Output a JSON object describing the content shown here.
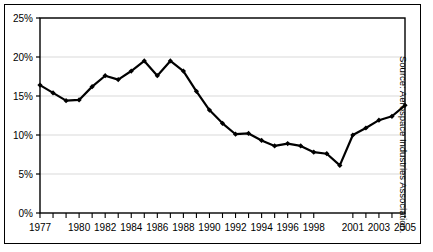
{
  "chart_data": {
    "type": "line",
    "title": "",
    "subtitle": "",
    "xlabel": "",
    "ylabel": "",
    "ylim": [
      0,
      25
    ],
    "ytick_labels": [
      "0%",
      "5%",
      "10%",
      "15%",
      "20%",
      "25%"
    ],
    "ytick_values": [
      0,
      5,
      10,
      15,
      20,
      25
    ],
    "xtick_labels": [
      "1977",
      "1980",
      "1982",
      "1984",
      "1986",
      "1988",
      "1990",
      "1992",
      "1994",
      "1996",
      "1998",
      "2001",
      "2003",
      "2005"
    ],
    "xlim": [
      1977,
      2005
    ],
    "grid": true,
    "legend": false,
    "markers": true,
    "series": [
      {
        "name": "series-1",
        "x": [
          1977,
          1978,
          1979,
          1980,
          1981,
          1982,
          1983,
          1984,
          1985,
          1986,
          1987,
          1988,
          1989,
          1990,
          1991,
          1992,
          1993,
          1994,
          1995,
          1996,
          1997,
          1998
        ],
        "values": [
          16.4,
          15.4,
          14.4,
          14.5,
          16.2,
          17.6,
          17.1,
          18.2,
          19.5,
          17.6,
          19.5,
          18.2,
          15.6,
          13.2,
          11.5,
          10.1,
          10.2,
          9.3,
          8.6,
          8.9,
          8.6,
          7.8
        ]
      },
      {
        "name": "series-2",
        "x": [
          1999,
          2000,
          2001,
          2002,
          2003,
          2004,
          2005
        ],
        "values": [
          7.6,
          6.1,
          10.0,
          10.9,
          11.9,
          12.4,
          13.2
        ]
      },
      {
        "name": "series-3",
        "x": [
          2005
        ],
        "values": [
          13.8
        ]
      }
    ],
    "points": [
      {
        "year": 1977,
        "value": 16.4
      },
      {
        "year": 1978,
        "value": 15.4
      },
      {
        "year": 1979,
        "value": 14.4
      },
      {
        "year": 1980,
        "value": 14.5
      },
      {
        "year": 1981,
        "value": 16.2
      },
      {
        "year": 1982,
        "value": 17.6
      },
      {
        "year": 1983,
        "value": 17.1
      },
      {
        "year": 1984,
        "value": 18.2
      },
      {
        "year": 1985,
        "value": 19.5
      },
      {
        "year": 1986,
        "value": 17.6
      },
      {
        "year": 1987,
        "value": 19.5
      },
      {
        "year": 1988,
        "value": 18.2
      },
      {
        "year": 1989,
        "value": 15.6
      },
      {
        "year": 1990,
        "value": 13.2
      },
      {
        "year": 1991,
        "value": 11.5
      },
      {
        "year": 1992,
        "value": 10.1
      },
      {
        "year": 1993,
        "value": 10.2
      },
      {
        "year": 1994,
        "value": 9.3
      },
      {
        "year": 1995,
        "value": 8.6
      },
      {
        "year": 1996,
        "value": 8.9
      },
      {
        "year": 1997,
        "value": 8.6
      },
      {
        "year": 1998,
        "value": 7.8
      },
      {
        "year": 1999,
        "value": 7.6
      },
      {
        "year": 2000,
        "value": 6.1
      },
      {
        "year": 2001,
        "value": 10.0
      },
      {
        "year": 2002,
        "value": 10.9
      },
      {
        "year": 2003,
        "value": 11.9
      },
      {
        "year": 2004,
        "value": 12.4
      },
      {
        "year": 2005,
        "value": 13.8
      }
    ],
    "colors": {
      "line": "#000000",
      "marker": "#000000",
      "grid": "#d9d9d9",
      "axis": "#000000",
      "background": "#ffffff"
    }
  },
  "source_note": "Source: Aerospace Industries Association."
}
